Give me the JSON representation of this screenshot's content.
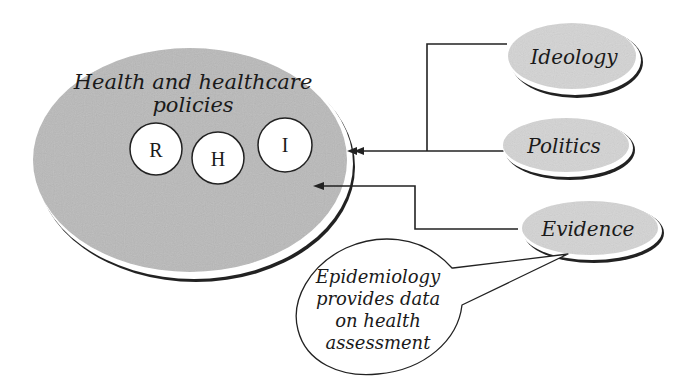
{
  "diagram": {
    "main": {
      "title_line1": "Health and healthcare",
      "title_line2": "policies",
      "circles": [
        {
          "label": "R"
        },
        {
          "label": "H"
        },
        {
          "label": "I"
        }
      ]
    },
    "inputs": [
      {
        "label": "Ideology"
      },
      {
        "label": "Politics"
      },
      {
        "label": "Evidence"
      }
    ],
    "callout": {
      "lines": [
        "Epidemiology",
        "provides data",
        "on health",
        "assessment"
      ]
    },
    "colors": {
      "fill_gray": "#b9b9b9",
      "fill_light_gray": "#d4d4d4",
      "stroke": "#222222",
      "background": "#ffffff"
    }
  }
}
